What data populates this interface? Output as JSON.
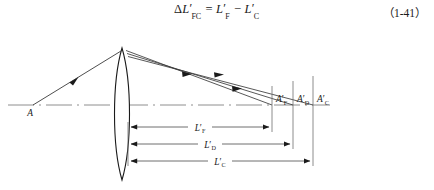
{
  "equation": {
    "text": "ΔL′FC = L′F − L′C",
    "lhs_delta": "Δ",
    "lhs_var": "L",
    "lhs_prime": "′",
    "lhs_sub": "FC",
    "equals": "=",
    "rhs1_var": "L",
    "rhs1_prime": "′",
    "rhs1_sub": "F",
    "minus": "−",
    "rhs2_var": "L",
    "rhs2_prime": "′",
    "rhs2_sub": "C",
    "number": "（1-41）"
  },
  "figure": {
    "type": "optics-ray-diagram",
    "caption": "",
    "axis_label": "optical-axis",
    "object_point": {
      "label": "A",
      "x": 33,
      "y": 79
    },
    "lens": {
      "label": "lens",
      "center_x": 122,
      "top_y": 22,
      "bottom_y": 154,
      "half_width": 10
    },
    "image_points": [
      {
        "id": "F",
        "label_var": "A",
        "label_prime": "′",
        "label_sub": "F",
        "x": 272,
        "y": 79
      },
      {
        "id": "D",
        "label_var": "A",
        "label_prime": "′",
        "label_sub": "D",
        "x": 293,
        "y": 79
      },
      {
        "id": "C",
        "label_var": "A",
        "label_prime": "′",
        "label_sub": "C",
        "x": 313,
        "y": 79
      }
    ],
    "dimensions": [
      {
        "id": "LF",
        "label_var": "L",
        "label_prime": "′",
        "label_sub": "F",
        "from_x": 128,
        "to_x": 272,
        "y": 101,
        "label_x": 200
      },
      {
        "id": "LD",
        "label_var": "L",
        "label_prime": "′",
        "label_sub": "D",
        "from_x": 128,
        "to_x": 293,
        "y": 118,
        "label_x": 210
      },
      {
        "id": "LC",
        "label_var": "L",
        "label_prime": "′",
        "label_sub": "C",
        "from_x": 128,
        "to_x": 313,
        "y": 135,
        "label_x": 220
      }
    ],
    "rays": [
      {
        "id": "incident",
        "from_x": 33,
        "from_y": 79,
        "to_x": 120,
        "to_y": 25,
        "arrow_at": 0.55
      },
      {
        "id": "refracted-F",
        "from_x": 126,
        "from_y": 25,
        "to_x": 272,
        "to_y": 79,
        "arrow_at": 0.62
      },
      {
        "id": "refracted-D",
        "from_x": 127,
        "from_y": 27,
        "to_x": 293,
        "to_y": 79,
        "arrow_at": 0.58
      },
      {
        "id": "refracted-C",
        "from_x": 128,
        "from_y": 29,
        "to_x": 313,
        "to_y": 79,
        "arrow_at": 0.54
      }
    ]
  },
  "colors": {
    "ink": "#1a1a1a",
    "axis": "#8a8a8a",
    "dimension": "#6e6e6e",
    "background": "#ffffff"
  }
}
